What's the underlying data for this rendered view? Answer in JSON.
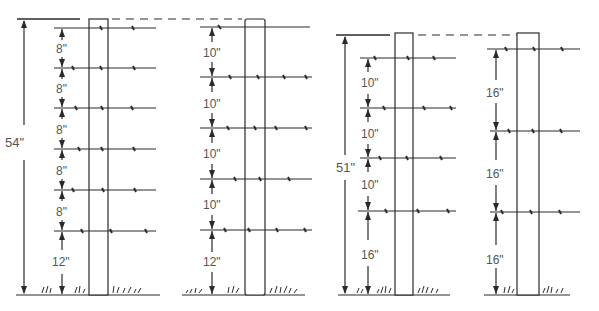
{
  "colors": {
    "line": "#2a2a2a",
    "text": "#555555",
    "background": "#ffffff"
  },
  "fences": [
    {
      "id": "fence-1",
      "total_height_label": "54\"",
      "spacing_labels": [
        "8\"",
        "8\"",
        "8\"",
        "8\"",
        "8\"",
        "12\""
      ],
      "wire_count": 6
    },
    {
      "id": "fence-2",
      "total_height_label": "",
      "spacing_labels": [
        "10\"",
        "10\"",
        "10\"",
        "10\"",
        "12\""
      ],
      "wire_count": 5
    },
    {
      "id": "fence-3",
      "total_height_label": "51\"",
      "spacing_labels": [
        "10\"",
        "10\"",
        "10\"",
        "16\""
      ],
      "wire_count": 4
    },
    {
      "id": "fence-4",
      "total_height_label": "",
      "spacing_labels": [
        "16\"",
        "16\"",
        "16\""
      ],
      "wire_count": 3
    }
  ]
}
